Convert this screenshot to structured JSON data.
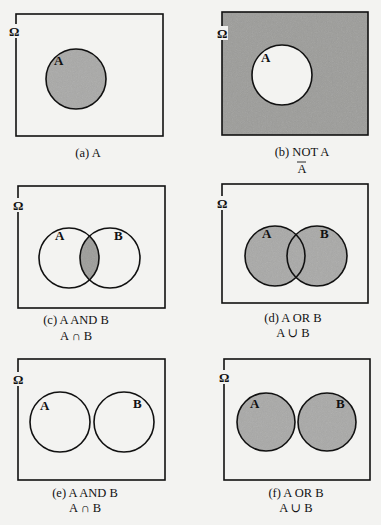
{
  "colors": {
    "background": "#f3f3f1",
    "shade": "#a9a9a7",
    "shade_dark": "#9c9c9a",
    "stroke": "#111111"
  },
  "universe_label": "Ω",
  "panels": [
    {
      "id": "a",
      "caption": "(a) A",
      "notation": "",
      "sets": [
        "A"
      ],
      "shaded_region": "A"
    },
    {
      "id": "b",
      "caption": "(b) NOT A",
      "notation": "A",
      "notation_overline": true,
      "sets": [
        "A"
      ],
      "shaded_region": "complement of A"
    },
    {
      "id": "c",
      "caption": "(c) A AND B",
      "notation": "A ∩ B",
      "sets": [
        "A",
        "B"
      ],
      "shaded_region": "intersection of A and B (overlapping)"
    },
    {
      "id": "d",
      "caption": "(d) A OR B",
      "notation": "A ∪ B",
      "sets": [
        "A",
        "B"
      ],
      "shaded_region": "union of A and B (overlapping)"
    },
    {
      "id": "e",
      "caption": "(e) A AND B",
      "notation": "A ∩ B",
      "sets": [
        "A",
        "B"
      ],
      "shaded_region": "none (disjoint sets)"
    },
    {
      "id": "f",
      "caption": "(f) A OR B",
      "notation": "A ∪ B",
      "sets": [
        "A",
        "B"
      ],
      "shaded_region": "union of A and B (disjoint)"
    }
  ]
}
